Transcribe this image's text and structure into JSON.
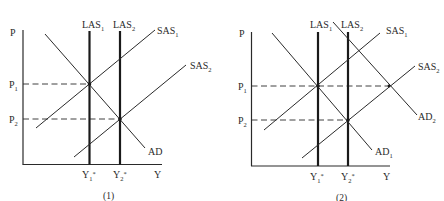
{
  "figure": {
    "type": "AD-AS macroeconomic diagram",
    "panels": [
      {
        "caption": "(1)",
        "axes": {
          "y_label": "P",
          "x_label": "Y"
        },
        "price_levels": [
          {
            "main": "P",
            "sub": "1"
          },
          {
            "main": "P",
            "sub": "2"
          }
        ],
        "output_levels": [
          {
            "main": "Y",
            "sub": "1",
            "sup": "*"
          },
          {
            "main": "Y",
            "sub": "2",
            "sup": "*"
          }
        ],
        "curves": {
          "las1": {
            "main": "LAS",
            "sub": "1"
          },
          "las2": {
            "main": "LAS",
            "sub": "2"
          },
          "sas1": {
            "main": "SAS",
            "sub": "1"
          },
          "sas2": {
            "main": "SAS",
            "sub": "2"
          },
          "ad": {
            "main": "AD",
            "sub": ""
          }
        }
      },
      {
        "caption": "(2)",
        "axes": {
          "y_label": "P",
          "x_label": "Y"
        },
        "price_levels": [
          {
            "main": "P",
            "sub": "1"
          },
          {
            "main": "P",
            "sub": "2"
          }
        ],
        "output_levels": [
          {
            "main": "Y",
            "sub": "1",
            "sup": "*"
          },
          {
            "main": "Y",
            "sub": "2",
            "sup": "*"
          }
        ],
        "curves": {
          "las1": {
            "main": "LAS",
            "sub": "1"
          },
          "las2": {
            "main": "LAS",
            "sub": "2"
          },
          "sas1": {
            "main": "SAS",
            "sub": "1"
          },
          "sas2": {
            "main": "SAS",
            "sub": "2"
          },
          "ad1": {
            "main": "AD",
            "sub": "1"
          },
          "ad2": {
            "main": "AD",
            "sub": "2"
          }
        }
      }
    ]
  }
}
